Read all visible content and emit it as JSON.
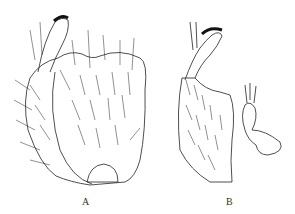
{
  "figure": {
    "panels": [
      {
        "id": "A",
        "label": "A",
        "description": "Ventral/lateral view of abdominal segment with setae and brush-like process"
      },
      {
        "id": "B",
        "label": "B",
        "description": "Lateral view of segment with brush-like process and adjacent structure"
      }
    ],
    "colors": {
      "ink": "#222222",
      "background": "#ffffff"
    }
  }
}
